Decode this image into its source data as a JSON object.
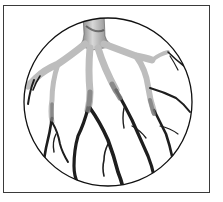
{
  "figure": {
    "frame": {
      "stroke": "#3a3a3a",
      "fill": "#ffffff"
    },
    "circle": {
      "cx": 108,
      "cy": 102,
      "r": 84,
      "stroke": "#111111"
    },
    "colors": {
      "root_light": "#c9c9c9",
      "root_mid": "#8a8a8a",
      "root_dark": "#1e1e1e"
    }
  }
}
